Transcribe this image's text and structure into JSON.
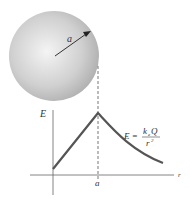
{
  "diagram": {
    "sphere": {
      "radius_label": "a",
      "fill_light": "#f2f2f2",
      "fill_dark": "#a9a9a9"
    },
    "graph": {
      "y_axis_label": "E",
      "x_axis_label": "r",
      "x_tick_label": "a",
      "formula": {
        "lhs": "E =",
        "numerator_k": "k",
        "numerator_sub": "e",
        "numerator_q": "Q",
        "denominator": "r",
        "denominator_exp": "2"
      },
      "curve_color": "#555555"
    }
  }
}
